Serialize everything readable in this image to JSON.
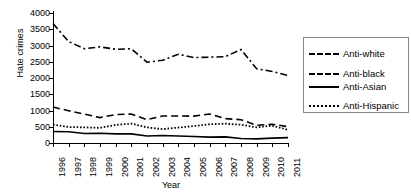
{
  "chart_data": {
    "type": "line",
    "title": "",
    "xlabel": "Year",
    "ylabel": "Hate crimes",
    "grid": false,
    "legend_position": "right",
    "ylim": [
      0,
      4000
    ],
    "yticks": [
      0,
      500,
      1000,
      1500,
      2000,
      2500,
      3000,
      3500,
      4000
    ],
    "categories": [
      "1996",
      "1997",
      "1998",
      "1999",
      "2000",
      "2001",
      "2002",
      "2003",
      "2004",
      "2005",
      "2006",
      "2007",
      "2008",
      "2009",
      "2010",
      "2011"
    ],
    "series": [
      {
        "name": "Anti-white",
        "style": "dashed",
        "color": "#000000",
        "values": [
          1106,
          993,
          890,
          781,
          875,
          891,
          719,
          830,
          829,
          828,
          890,
          749,
          716,
          545,
          575,
          504
        ]
      },
      {
        "name": "Anti-black",
        "style": "dash-dot",
        "color": "#000000",
        "values": [
          3674,
          3120,
          2901,
          2958,
          2884,
          2899,
          2486,
          2548,
          2731,
          2630,
          2640,
          2658,
          2876,
          2284,
          2201,
          2076
        ]
      },
      {
        "name": "Anti-Asian",
        "style": "solid",
        "color": "#000000",
        "values": [
          355,
          347,
          293,
          298,
          281,
          280,
          217,
          231,
          217,
          199,
          181,
          188,
          137,
          126,
          150,
          165
        ]
      },
      {
        "name": "Anti-Hispanic",
        "style": "dotted",
        "color": "#000000",
        "values": [
          564,
          491,
          482,
          466,
          557,
          597,
          480,
          426,
          475,
          522,
          576,
          595,
          561,
          483,
          534,
          405
        ]
      }
    ]
  },
  "legend": {
    "items": [
      {
        "label": "Anti-white",
        "style": "dashed"
      },
      {
        "label": "Anti-black",
        "style": "dashdot"
      },
      {
        "label": "Anti-Asian",
        "style": "solid"
      },
      {
        "label": "Anti-Hispanic",
        "style": "dotted"
      }
    ]
  }
}
